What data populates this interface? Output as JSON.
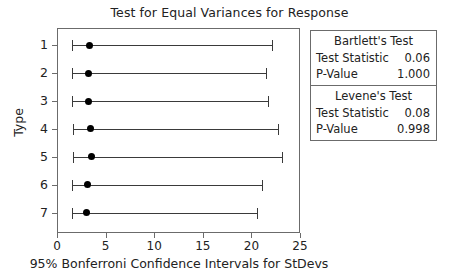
{
  "chart_data": {
    "type": "scatter",
    "title": "Test for Equal Variances for Response",
    "xlabel": "95% Bonferroni Confidence Intervals for StDevs",
    "ylabel": "Type",
    "xlim": [
      0,
      25
    ],
    "xticks": [
      0,
      5,
      10,
      15,
      20,
      25
    ],
    "xtick_labels": [
      "0",
      "5",
      "10",
      "15",
      "20",
      "25"
    ],
    "categories": [
      "1",
      "2",
      "3",
      "4",
      "5",
      "6",
      "7"
    ],
    "grid": false,
    "legend": "none",
    "series": [
      {
        "name": "95% Bonferroni CI for StDev",
        "points": [
          {
            "category": "1",
            "estimate": 3.2,
            "lower": 1.4,
            "upper": 22.0
          },
          {
            "category": "2",
            "estimate": 3.1,
            "lower": 1.4,
            "upper": 21.4
          },
          {
            "category": "3",
            "estimate": 3.1,
            "lower": 1.4,
            "upper": 21.6
          },
          {
            "category": "4",
            "estimate": 3.3,
            "lower": 1.5,
            "upper": 22.6
          },
          {
            "category": "5",
            "estimate": 3.4,
            "lower": 1.5,
            "upper": 23.0
          },
          {
            "category": "6",
            "estimate": 3.0,
            "lower": 1.4,
            "upper": 21.0
          },
          {
            "category": "7",
            "estimate": 2.9,
            "lower": 1.4,
            "upper": 20.5
          }
        ]
      }
    ]
  },
  "stats_panel": {
    "blocks": [
      {
        "heading": "Bartlett's Test",
        "rows": [
          {
            "label": "Test Statistic",
            "value": "0.06"
          },
          {
            "label": "P-Value",
            "value": "1.000"
          }
        ]
      },
      {
        "heading": "Levene's Test",
        "rows": [
          {
            "label": "Test Statistic",
            "value": "0.08"
          },
          {
            "label": "P-Value",
            "value": "0.998"
          }
        ]
      }
    ]
  },
  "colors": {
    "marker": "#000000",
    "line": "#3a3a3a",
    "frame": "#6b6b6b",
    "text": "#222222",
    "background": "#ffffff"
  }
}
